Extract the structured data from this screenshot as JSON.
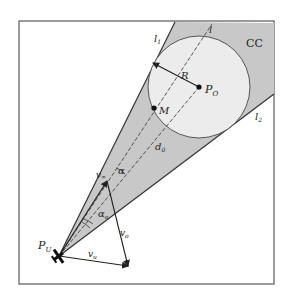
{
  "figure": {
    "region_label": "CC",
    "lines": {
      "l1": "l",
      "l1_sub": "1",
      "l2": "l",
      "l2_sub": "2",
      "l": "l"
    },
    "obstacle": {
      "center_label": "P",
      "center_sub": "O",
      "radius_label": "R"
    },
    "point_m": "M",
    "distance": {
      "label": "d",
      "sub": "0"
    },
    "uav": {
      "label": "P",
      "sub": "U"
    },
    "vectors": {
      "v_inf": {
        "label": "v",
        "sub": "∞"
      },
      "v_o": {
        "label": "v",
        "sub": "o"
      },
      "v_u": {
        "label": "v",
        "sub": "u"
      }
    },
    "angles": {
      "alpha": "α",
      "alpha_o": {
        "label": "α",
        "sub": "o"
      }
    },
    "colors": {
      "cone_fill": "#c8c8c8",
      "circle_fill": "#ececec",
      "stroke": "#333333",
      "frame": "#666666"
    }
  }
}
